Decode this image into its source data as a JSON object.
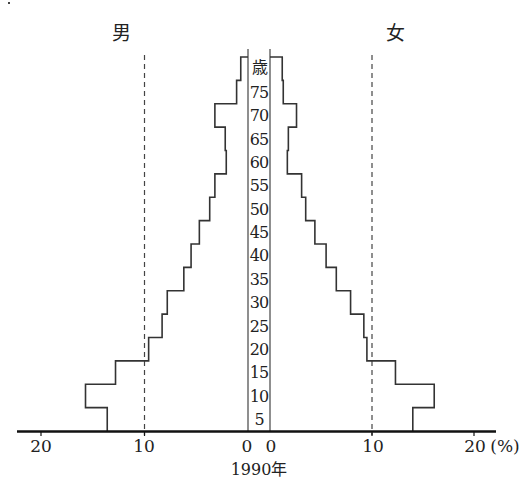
{
  "chart_data": {
    "type": "bar",
    "subtype": "population-pyramid",
    "title": "",
    "year_label": "1990年",
    "left_side_label": "男",
    "right_side_label": "女",
    "age_unit_label": "歳",
    "xlabel": "(%)",
    "ylabel": "歳",
    "x_ticks_left": [
      "20",
      "10",
      "0"
    ],
    "x_ticks_right": [
      "0",
      "10",
      "20"
    ],
    "x_unit": "(%)",
    "xlim": [
      0,
      20
    ],
    "gridlines": "dashed at 10% both sides",
    "age_tick_labels": [
      "5",
      "10",
      "15",
      "20",
      "25",
      "30",
      "35",
      "40",
      "45",
      "50",
      "55",
      "60",
      "65",
      "70",
      "75"
    ],
    "categories": [
      "0-4",
      "5-9",
      "10-14",
      "15-19",
      "20-24",
      "25-29",
      "30-34",
      "35-39",
      "40-44",
      "45-49",
      "50-54",
      "55-59",
      "60-64",
      "65-69",
      "70-74",
      "75+"
    ],
    "series": [
      {
        "name": "男",
        "side": "left",
        "values": [
          13.6,
          15.7,
          12.8,
          9.6,
          8.3,
          7.8,
          6.2,
          5.5,
          4.7,
          3.7,
          3.2,
          2.1,
          2.2,
          3.2,
          1.1,
          0.7
        ]
      },
      {
        "name": "女",
        "side": "right",
        "values": [
          14.0,
          16.1,
          12.3,
          9.5,
          9.2,
          7.9,
          6.5,
          5.5,
          4.4,
          3.5,
          3.1,
          1.7,
          1.8,
          2.6,
          1.3,
          1.2
        ]
      }
    ]
  },
  "labels": {
    "male": "男",
    "female": "女",
    "age_unit": "歳",
    "year": "1990年",
    "percent_unit": "(%)",
    "ticks": {
      "l20": "20",
      "l10": "10",
      "l0": "0",
      "r0": "0",
      "r10": "10",
      "r20": "20"
    },
    "ages": [
      "5",
      "10",
      "15",
      "20",
      "25",
      "30",
      "35",
      "40",
      "45",
      "50",
      "55",
      "60",
      "65",
      "70",
      "75"
    ]
  }
}
